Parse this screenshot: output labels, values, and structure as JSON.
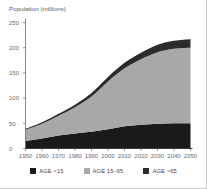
{
  "chart_data": {
    "type": "area",
    "stacked": true,
    "title": "",
    "ylabel": "Population (millions)",
    "xlabel": "",
    "ylim": [
      0,
      250
    ],
    "xlim": [
      1950,
      2050
    ],
    "grid": false,
    "legend_position": "bottom",
    "x": [
      1950,
      1960,
      1970,
      1980,
      1990,
      2000,
      2010,
      2020,
      2030,
      2040,
      2050
    ],
    "xticklabels": [
      "1950",
      "1960",
      "1970",
      "1980",
      "1990",
      "2000",
      "2010",
      "2020",
      "2030",
      "2040",
      "2050"
    ],
    "yticklabels": [
      "0",
      "50",
      "100",
      "150",
      "200",
      "250"
    ],
    "yticks": [
      0,
      50,
      100,
      150,
      200,
      250
    ],
    "series": [
      {
        "name": "AGE <15",
        "color": "#1a1a1a",
        "values": [
          15,
          20,
          26,
          30,
          33,
          38,
          44,
          47,
          49,
          50,
          50
        ]
      },
      {
        "name": "AGE 15–65",
        "color": "#a8a8a8",
        "values": [
          22,
          29,
          39,
          52,
          70,
          95,
          115,
          130,
          142,
          148,
          150
        ]
      },
      {
        "name": "AGE >65",
        "color": "#2b2b2b",
        "values": [
          2,
          3,
          4,
          5,
          7,
          9,
          11,
          13,
          15,
          16,
          17
        ]
      }
    ],
    "totals": [
      39,
      52,
      69,
      87,
      110,
      142,
      170,
      190,
      206,
      214,
      217
    ]
  },
  "legend": {
    "items": [
      {
        "label": "AGE <15",
        "color": "#1a1a1a",
        "swatch": "legend-swatch-age-under-15"
      },
      {
        "label": "AGE 15–65",
        "color": "#a8a8a8",
        "swatch": "legend-swatch-age-15-65"
      },
      {
        "label": "AGE >65",
        "color": "#2b2b2b",
        "swatch": "legend-swatch-age-over-65"
      }
    ]
  },
  "axes": {
    "y_title": "Population (millions)"
  }
}
